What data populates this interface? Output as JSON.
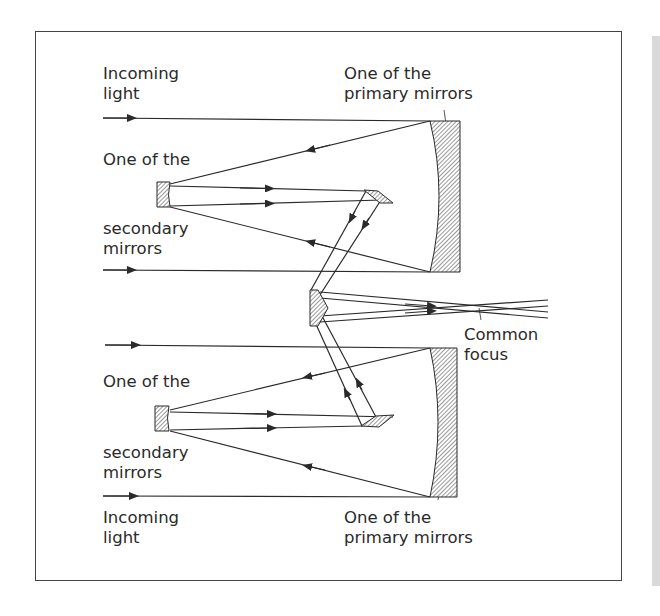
{
  "diagram": {
    "type": "optical-ray-diagram",
    "labels": {
      "incoming_light_top": [
        "Incoming",
        "light"
      ],
      "secondary_top": [
        "One of the"
      ],
      "secondary_top_cont": [
        "secondary",
        "mirrors"
      ],
      "primary_top": [
        "One of the",
        "primary mirrors"
      ],
      "common_focus": [
        "Common",
        "focus"
      ],
      "secondary_bottom": [
        "One of the"
      ],
      "secondary_bottom_cont": [
        "secondary",
        "mirrors"
      ],
      "incoming_light_bottom": [
        "Incoming",
        "light"
      ],
      "primary_bottom": [
        "One of the",
        "primary mirrors"
      ]
    },
    "colors": {
      "line": "#2a2a2a",
      "frame": "#444444",
      "hatch": "#555555",
      "background": "#ffffff",
      "side_strip": "#d9d9d9"
    }
  }
}
